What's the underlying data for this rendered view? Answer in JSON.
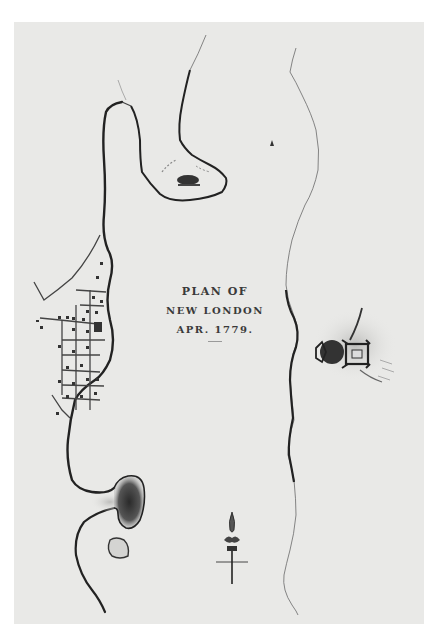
{
  "map": {
    "title_line1": "PLAN OF",
    "title_line2": "NEW LONDON",
    "title_line3": "APR. 1779.",
    "features": [
      {
        "name": "town-new-london",
        "description": "street grid with buildings on west bank"
      },
      {
        "name": "fort-trumbull-peninsula",
        "description": "peninsula with battery north of town"
      },
      {
        "name": "groton-fort",
        "description": "star fort on east bank (Fort Griswold)"
      },
      {
        "name": "southern-point",
        "description": "shaded point with small island below"
      },
      {
        "name": "thames-river-east-bank",
        "description": "shoreline on east side of river"
      },
      {
        "name": "compass-rose",
        "description": "fleur-de-lis north arrow"
      }
    ],
    "colors": {
      "paper": "#e9e9e7",
      "ink": "#2a2a2a",
      "border": "#ffffff"
    }
  }
}
